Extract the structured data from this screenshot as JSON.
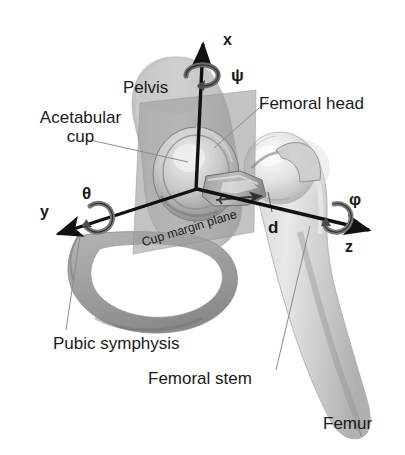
{
  "figure": {
    "background_color": "#ffffff",
    "width": 405,
    "height": 455
  },
  "anatomy_labels": {
    "pelvis": "Pelvis",
    "acetabular_cup_line1": "Acetabular",
    "acetabular_cup_line2": "cup",
    "femoral_head": "Femoral head",
    "pubic_symphysis": "Pubic symphysis",
    "femoral_stem": "Femoral stem",
    "femur": "Femur",
    "cup_margin_plane": "Cup margin plane"
  },
  "axes": {
    "x_label": "x",
    "y_label": "y",
    "z_label": "z",
    "origin_description": "hip joint centre"
  },
  "rotations": {
    "psi": "ψ",
    "theta": "θ",
    "phi": "φ"
  },
  "measurements": {
    "d_label": "d"
  },
  "colors": {
    "axis": "#111111",
    "bone_light": "#d9d9d9",
    "bone_mid": "#bdbdbd",
    "bone_dark": "#9a9a9a",
    "plane_gray": "#9e9e9e",
    "text": "#1a1a1a",
    "leader_line": "#8c8c8c"
  }
}
